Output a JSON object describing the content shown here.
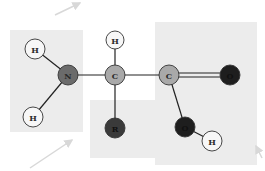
{
  "diagram": {
    "title": "",
    "type": "amino-acid-structure",
    "colors": {
      "background": "#ffffff",
      "region_fill": "#ececec",
      "hydrogen": "#f7f7f7",
      "carbon": "#a9a9a9",
      "nitrogen": "#6b6b6b",
      "oxygen": "#1e1e1e",
      "r_group": "#3a3a3a",
      "bond": "#222222",
      "arrow": "#d8d8d8"
    },
    "regions": [
      {
        "id": "amino-group",
        "x": 10,
        "y": 30,
        "w": 73,
        "h": 102
      },
      {
        "id": "r-group",
        "x": 90,
        "y": 100,
        "w": 68,
        "h": 58
      },
      {
        "id": "carboxyl-group",
        "x": 155,
        "y": 22,
        "w": 102,
        "h": 143
      }
    ],
    "atoms": [
      {
        "id": "h1",
        "label": "H",
        "x": 35,
        "y": 49,
        "r": 10,
        "kind": "hydrogen"
      },
      {
        "id": "h2",
        "label": "H",
        "x": 33,
        "y": 117,
        "r": 10,
        "kind": "hydrogen"
      },
      {
        "id": "n",
        "label": "N",
        "x": 68,
        "y": 75,
        "r": 10,
        "kind": "nitrogen"
      },
      {
        "id": "c-alpha",
        "label": "C",
        "x": 115,
        "y": 75,
        "r": 10,
        "kind": "carbon"
      },
      {
        "id": "h3",
        "label": "H",
        "x": 115,
        "y": 40,
        "r": 9,
        "kind": "hydrogen"
      },
      {
        "id": "r",
        "label": "R",
        "x": 115,
        "y": 128,
        "r": 10,
        "kind": "r_group"
      },
      {
        "id": "c-carboxyl",
        "label": "C",
        "x": 169,
        "y": 75,
        "r": 10,
        "kind": "carbon"
      },
      {
        "id": "o1",
        "label": "O",
        "x": 230,
        "y": 75,
        "r": 10,
        "kind": "oxygen"
      },
      {
        "id": "o2",
        "label": "O",
        "x": 185,
        "y": 127,
        "r": 10,
        "kind": "oxygen"
      },
      {
        "id": "h4",
        "label": "H",
        "x": 212,
        "y": 141,
        "r": 10,
        "kind": "hydrogen"
      }
    ],
    "bonds": [
      {
        "from": "h1",
        "to": "n",
        "order": 1
      },
      {
        "from": "h2",
        "to": "n",
        "order": 1
      },
      {
        "from": "n",
        "to": "c-alpha",
        "order": 1
      },
      {
        "from": "c-alpha",
        "to": "h3",
        "order": 1
      },
      {
        "from": "c-alpha",
        "to": "r",
        "order": 1
      },
      {
        "from": "c-alpha",
        "to": "c-carboxyl",
        "order": 1
      },
      {
        "from": "c-carboxyl",
        "to": "o1",
        "order": 2
      },
      {
        "from": "c-carboxyl",
        "to": "o2",
        "order": 1
      },
      {
        "from": "o2",
        "to": "h4",
        "order": 1
      }
    ],
    "arrows": [
      {
        "id": "arrow-top",
        "x1": 55,
        "y1": 15,
        "x2": 80,
        "y2": 3
      },
      {
        "id": "arrow-bottom-left",
        "x1": 30,
        "y1": 168,
        "x2": 72,
        "y2": 140
      },
      {
        "id": "arrow-bottom-right",
        "x1": 262,
        "y1": 158,
        "x2": 256,
        "y2": 146
      }
    ]
  }
}
